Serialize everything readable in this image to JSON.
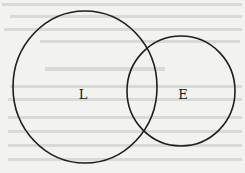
{
  "diagram": {
    "type": "venn",
    "sets": [
      {
        "id": "L",
        "label": "L"
      },
      {
        "id": "E",
        "label": "E"
      }
    ],
    "relationship": "overlapping"
  },
  "colors": {
    "background": "#f2f2f0",
    "stroke": "#1e1e1e",
    "text": "#1a1a1a"
  }
}
